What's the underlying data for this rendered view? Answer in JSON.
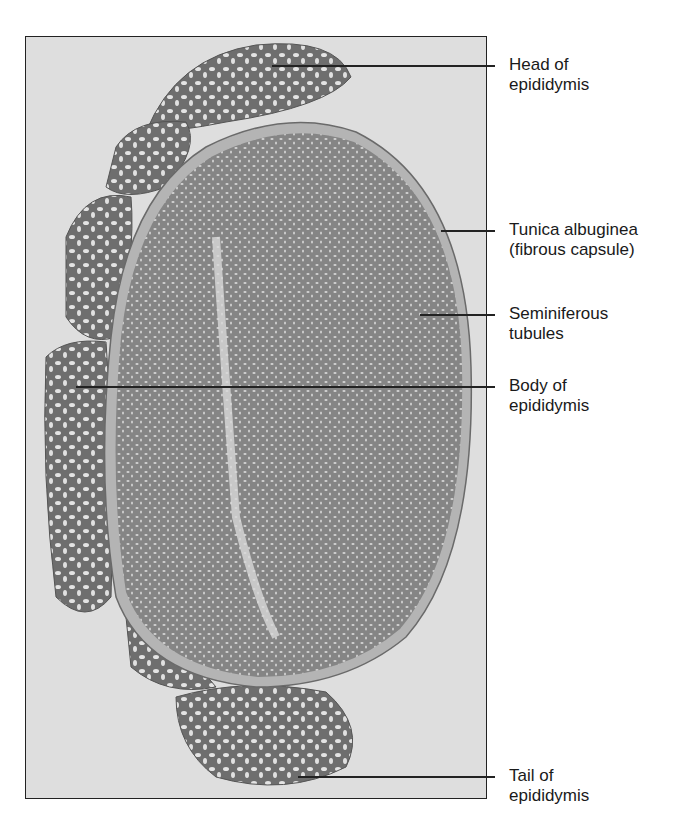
{
  "figure": {
    "labels": [
      {
        "id": "head",
        "line1": "Head of",
        "line2": "epididymis"
      },
      {
        "id": "tunica",
        "line1": "Tunica albuginea",
        "line2": "(fibrous capsule)"
      },
      {
        "id": "seminiferous",
        "line1": "Seminiferous",
        "line2": "tubules"
      },
      {
        "id": "body",
        "line1": "Body of",
        "line2": "epididymis"
      },
      {
        "id": "tail",
        "line1": "Tail of",
        "line2": "epididymis"
      }
    ],
    "colors": {
      "background": "#dedede",
      "testis_tissue": "#8a8a8a",
      "capsule": "#b4b4b4",
      "epididymis_tissue": "#7c7c7c",
      "leader_line": "#222222"
    }
  }
}
